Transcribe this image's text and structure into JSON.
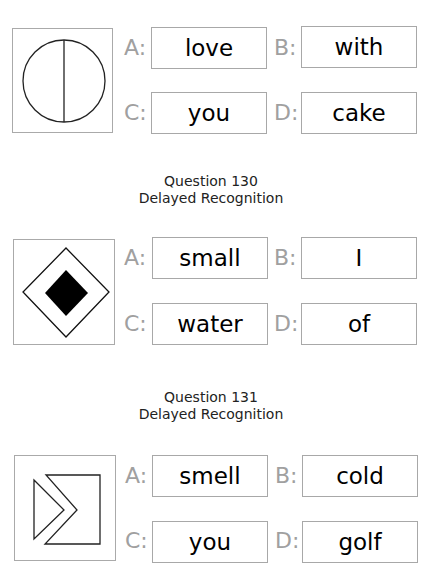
{
  "questions": [
    {
      "stimulus_icon": "circle-vertical-line",
      "options": {
        "A": {
          "label": "A:",
          "word": "love"
        },
        "B": {
          "label": "B:",
          "word": "with"
        },
        "C": {
          "label": "C:",
          "word": "you"
        },
        "D": {
          "label": "D:",
          "word": "cake"
        }
      }
    },
    {
      "number_text": "Question 130",
      "type_text": "Delayed Recognition",
      "stimulus_icon": "diamond-in-diamond",
      "options": {
        "A": {
          "label": "A:",
          "word": "small"
        },
        "B": {
          "label": "B:",
          "word": "I"
        },
        "C": {
          "label": "C:",
          "word": "water"
        },
        "D": {
          "label": "D:",
          "word": "of"
        }
      }
    },
    {
      "number_text": "Question 131",
      "type_text": "Delayed Recognition",
      "stimulus_icon": "chevron-triangle",
      "options": {
        "A": {
          "label": "A:",
          "word": "smell"
        },
        "B": {
          "label": "B:",
          "word": "cold"
        },
        "C": {
          "label": "C:",
          "word": "you"
        },
        "D": {
          "label": "D:",
          "word": "golf"
        }
      }
    }
  ]
}
